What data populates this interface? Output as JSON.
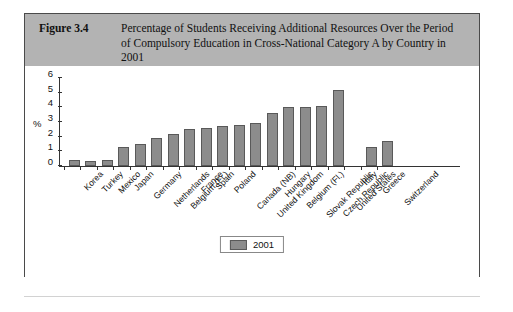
{
  "figure": {
    "number": "Figure 3.4",
    "caption": "Percentage of Students Receiving Additional Resources Over the Period of Compulsory Education in Cross-National Category A by Country in 2001"
  },
  "legend": {
    "label": "2001"
  },
  "chart_data": {
    "type": "bar",
    "title": "Percentage of Students Receiving Additional Resources Over the Period of Compulsory Education in Cross-National Category A by Country in 2001",
    "xlabel": "",
    "ylabel": "%",
    "ylim": [
      0,
      6
    ],
    "yticks": [
      0,
      1,
      2,
      3,
      4,
      5,
      6
    ],
    "grid": false,
    "legend_position": "bottom-center",
    "series": [
      {
        "name": "2001",
        "color": "#8c8c8c",
        "values": [
          0.4,
          0.35,
          0.4,
          1.3,
          1.5,
          1.9,
          2.2,
          2.5,
          2.6,
          2.7,
          2.8,
          2.9,
          3.6,
          4.0,
          4.0,
          4.1,
          5.2,
          0,
          1.3,
          1.7
        ]
      }
    ],
    "categories": [
      "Korea",
      "Turkey",
      "Mexico",
      "Japan",
      "Germany",
      "Netherlands",
      "Belgium (Fr.)",
      "France",
      "Spain",
      "Poland",
      "Canada (NB)",
      "United Kingdom",
      "Hungary",
      "Belgium (Fl.)",
      "Slovak Republic",
      "Czech Republic",
      "United States",
      "Italy",
      "Greece",
      "Switzerland"
    ]
  }
}
